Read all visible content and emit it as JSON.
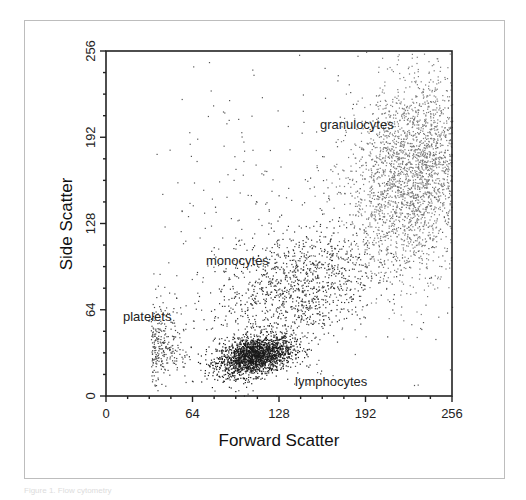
{
  "chart_data": {
    "type": "scatter",
    "title": "",
    "xlabel": "Forward Scatter",
    "ylabel": "Side Scatter",
    "xlim": [
      0,
      256
    ],
    "ylim": [
      0,
      256
    ],
    "xticks": [
      0,
      64,
      128,
      192,
      256
    ],
    "yticks": [
      0,
      64,
      128,
      192,
      256
    ],
    "minor_tick_step": 16,
    "grid": false,
    "legend": null,
    "annotations": [
      {
        "text": "granulocytes",
        "x": 156,
        "y": 200
      },
      {
        "text": "monocytes",
        "x": 70,
        "y": 101
      },
      {
        "text": "platelets",
        "x": 9,
        "y": 56
      },
      {
        "text": "lymphocytes",
        "x": 138,
        "y": 8
      }
    ],
    "populations": [
      {
        "name": "lymphocytes",
        "center": [
          110,
          30
        ],
        "spread": [
          14,
          7
        ],
        "count": 1900,
        "color": "#1a1a1a",
        "tilt": 0.35
      },
      {
        "name": "monocytes",
        "center": [
          140,
          80
        ],
        "spread": [
          30,
          22
        ],
        "count": 1100,
        "color": "#333333",
        "tilt": 0.6
      },
      {
        "name": "granulocytes",
        "center": [
          228,
          165
        ],
        "spread": [
          24,
          36
        ],
        "count": 2600,
        "color": "#7a7a7a",
        "tilt": 0.7
      },
      {
        "name": "platelets",
        "center": [
          40,
          38
        ],
        "spread": [
          8,
          14
        ],
        "count": 260,
        "color": "#444444",
        "tilt": 0.0
      },
      {
        "name": "background",
        "center": [
          150,
          120
        ],
        "spread": [
          80,
          70
        ],
        "count": 500,
        "color": "#555555",
        "tilt": 0.4
      }
    ]
  },
  "labels": {
    "x_title": "Forward Scatter",
    "y_title": "Side Scatter",
    "granulocytes": "granulocytes",
    "monocytes": "monocytes",
    "platelets": "platelets",
    "lymphocytes": "lymphocytes",
    "caption": "Figure 1. Flow cytometry"
  }
}
